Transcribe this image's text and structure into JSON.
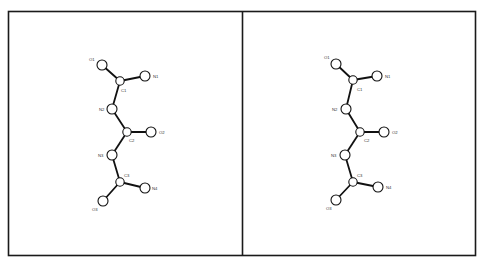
{
  "figure": {
    "type": "stereo-pair molecular diagram",
    "frame_color": "#1a1a1a",
    "bond_color": "#111111",
    "atom_fill": "#ffffff",
    "atom_radius": 5,
    "panels": [
      {
        "id": "left",
        "atoms": [
          {
            "label": "O1",
            "x": 102,
            "y": 65,
            "lx": 89,
            "ly": 61
          },
          {
            "label": "C1",
            "x": 120,
            "y": 81,
            "lx": 121,
            "ly": 92
          },
          {
            "label": "N1",
            "x": 145,
            "y": 76,
            "lx": 153,
            "ly": 78
          },
          {
            "label": "N2",
            "x": 112,
            "y": 109,
            "lx": 99,
            "ly": 111
          },
          {
            "label": "C2",
            "x": 127,
            "y": 132,
            "lx": 129,
            "ly": 142
          },
          {
            "label": "O2",
            "x": 151,
            "y": 132,
            "lx": 159,
            "ly": 134
          },
          {
            "label": "N3",
            "x": 112,
            "y": 155,
            "lx": 98,
            "ly": 157
          },
          {
            "label": "C3",
            "x": 120,
            "y": 182,
            "lx": 124,
            "ly": 177
          },
          {
            "label": "N4",
            "x": 145,
            "y": 188,
            "lx": 152,
            "ly": 190
          },
          {
            "label": "O3",
            "x": 103,
            "y": 201,
            "lx": 92,
            "ly": 211
          }
        ]
      },
      {
        "id": "right",
        "atoms": [
          {
            "label": "O1",
            "x": 336,
            "y": 64,
            "lx": 324,
            "ly": 59
          },
          {
            "label": "C1",
            "x": 353,
            "y": 80,
            "lx": 357,
            "ly": 91
          },
          {
            "label": "N1",
            "x": 377,
            "y": 76,
            "lx": 385,
            "ly": 78
          },
          {
            "label": "N2",
            "x": 346,
            "y": 109,
            "lx": 332,
            "ly": 111
          },
          {
            "label": "C2",
            "x": 360,
            "y": 132,
            "lx": 364,
            "ly": 142
          },
          {
            "label": "O2",
            "x": 384,
            "y": 132,
            "lx": 392,
            "ly": 134
          },
          {
            "label": "N3",
            "x": 345,
            "y": 155,
            "lx": 331,
            "ly": 157
          },
          {
            "label": "C3",
            "x": 353,
            "y": 182,
            "lx": 357,
            "ly": 177
          },
          {
            "label": "N4",
            "x": 378,
            "y": 187,
            "lx": 386,
            "ly": 189
          },
          {
            "label": "O3",
            "x": 336,
            "y": 200,
            "lx": 326,
            "ly": 210
          }
        ]
      }
    ],
    "bonds": [
      [
        "O1",
        "C1"
      ],
      [
        "C1",
        "N1"
      ],
      [
        "C1",
        "N2"
      ],
      [
        "N2",
        "C2"
      ],
      [
        "C2",
        "O2"
      ],
      [
        "C2",
        "N3"
      ],
      [
        "N3",
        "C3"
      ],
      [
        "C3",
        "N4"
      ],
      [
        "C3",
        "O3"
      ]
    ]
  }
}
